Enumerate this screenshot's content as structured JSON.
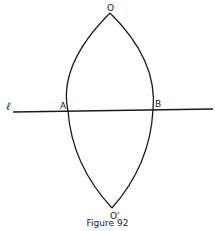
{
  "figure": {
    "caption": "Figure 92",
    "points": {
      "O": {
        "label": "O",
        "x": 110,
        "y": 13
      },
      "O_prime": {
        "label": "O'",
        "x": 112,
        "y": 208
      },
      "A": {
        "label": "A",
        "x": 69,
        "y": 111
      },
      "B": {
        "label": "B",
        "x": 153,
        "y": 110
      }
    },
    "line": {
      "label": "ℓ",
      "x1": 13,
      "y1": 112,
      "x2": 213,
      "y2": 109
    },
    "colors": {
      "stroke": "#1a1a1a",
      "background": "#ffffff"
    }
  }
}
